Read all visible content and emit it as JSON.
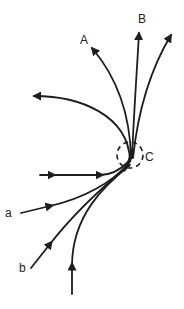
{
  "diagram": {
    "labels": {
      "A": "A",
      "B": "B",
      "C": "C",
      "a": "a",
      "b": "b"
    },
    "colors": {
      "stroke": "#1e1e1e",
      "background": "#ffffff"
    }
  }
}
